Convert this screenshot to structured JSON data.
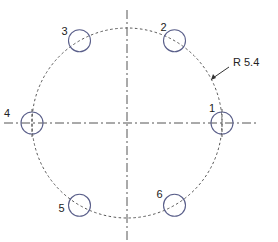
{
  "diagram": {
    "type": "bolt-circle-drawing",
    "bolt_circle": {
      "center": [
        127,
        123
      ],
      "radius": 95,
      "dimension_label": "R 5.4"
    },
    "hole_radius": 11,
    "holes": [
      {
        "id": "1",
        "label": "1",
        "angle_deg": 0
      },
      {
        "id": "2",
        "label": "2",
        "angle_deg": 60
      },
      {
        "id": "3",
        "label": "3",
        "angle_deg": 120
      },
      {
        "id": "4",
        "label": "4",
        "angle_deg": 180
      },
      {
        "id": "5",
        "label": "5",
        "angle_deg": 240
      },
      {
        "id": "6",
        "label": "6",
        "angle_deg": 300
      }
    ],
    "colors": {
      "hole_stroke": "#5a5f8a",
      "line_stroke": "#555555",
      "text": "#222222"
    }
  }
}
